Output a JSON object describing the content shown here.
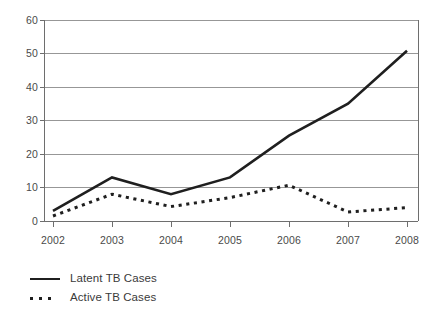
{
  "chart_data": {
    "type": "line",
    "title": "",
    "subtitle": "",
    "xlabel": "",
    "ylabel": "",
    "categories": [
      "2002",
      "2003",
      "2004",
      "2005",
      "2006",
      "2007",
      "2008"
    ],
    "x": [
      2002,
      2003,
      2004,
      2005,
      2006,
      2007,
      2008
    ],
    "series": [
      {
        "name": "Latent TB Cases",
        "style": "solid",
        "color": "#1f1f1f",
        "values": [
          3,
          13,
          8,
          13,
          25.5,
          35,
          50.8
        ]
      },
      {
        "name": "Active TB Cases",
        "style": "dotted",
        "color": "#1f1f1f",
        "values": [
          1.5,
          8,
          4.3,
          7,
          10.7,
          2.7,
          4
        ]
      }
    ],
    "ylim": [
      0,
      60
    ],
    "xlim": [
      2002,
      2008
    ],
    "yticks": [
      0,
      10,
      20,
      30,
      40,
      50,
      60
    ],
    "yticklabels": [
      "0",
      "10",
      "20",
      "30",
      "40",
      "50",
      "60"
    ],
    "xticklabels": [
      "2002",
      "2003",
      "2004",
      "2005",
      "2006",
      "2007",
      "2008"
    ],
    "grid": "horizontal",
    "grid_color": "#8c8c8c",
    "axis_color": "#6e6e6e",
    "plot_background": "#ffffff",
    "legend_position": "below-left",
    "legend": [
      "Latent TB Cases",
      "Active TB Cases"
    ]
  },
  "legend": {
    "items": [
      {
        "label": "Latent TB Cases",
        "key": "solid-line-key"
      },
      {
        "label": "Active TB Cases",
        "key": "dotted-line-key"
      }
    ]
  }
}
